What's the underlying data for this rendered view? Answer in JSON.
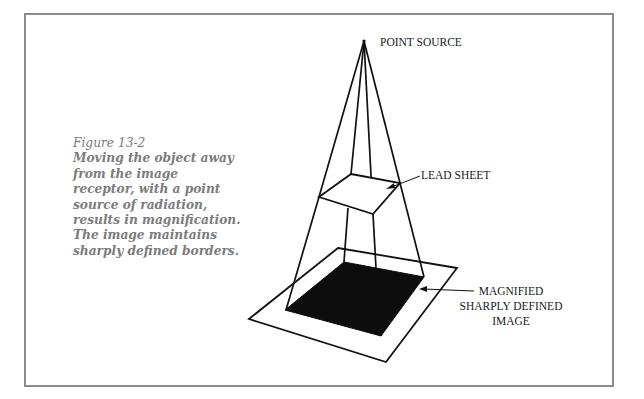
{
  "figure": {
    "number": "Figure 13-2",
    "caption": "Moving the object away from the image receptor, with a point source of radiation, results in magnification. The image maintains sharply defined borders."
  },
  "labels": {
    "point_source": "POINT SOURCE",
    "lead_sheet": "LEAD SHEET",
    "image_line1": "MAGNIFIED",
    "image_line2": "SHARPLY DEFINED",
    "image_line3": "IMAGE"
  },
  "colors": {
    "frame": "#8a8a8a",
    "caption_text": "#7b7b7b",
    "lines": "#111111",
    "image_fill": "#0d0d0d"
  }
}
